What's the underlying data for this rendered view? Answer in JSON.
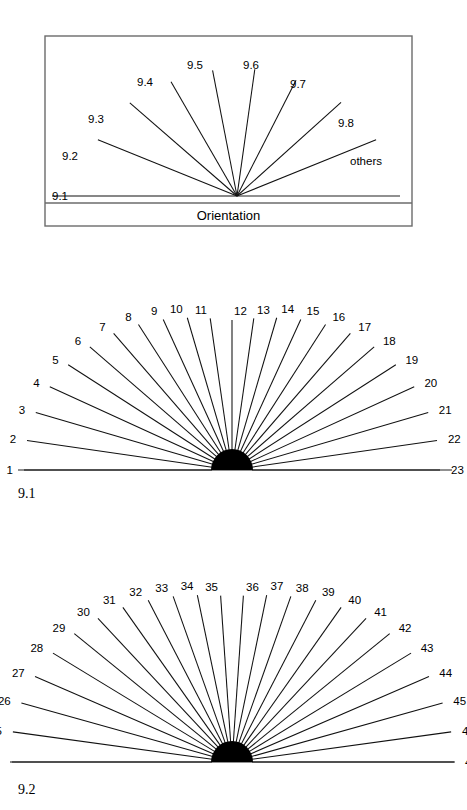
{
  "figure": {
    "background_color": "#ffffff",
    "ink_color": "#000000",
    "frame_color": "#6b6b6b"
  },
  "legend_panel": {
    "name": "orientation-legend",
    "caption": "Orientation",
    "frame": {
      "x": 45,
      "y": 8,
      "width": 367,
      "height": 190
    },
    "divider_y": 168,
    "hub": {
      "cx": 237,
      "cy": 168
    },
    "baseline": {
      "x1": 52,
      "x2": 400,
      "y": 168
    },
    "rays": [
      {
        "label": "9.1",
        "angle_deg": 180,
        "length": 185,
        "label_x": 52,
        "label_y": 172,
        "anchor": "start",
        "horizontal": true
      },
      {
        "label": "9.2",
        "angle_deg": 158,
        "length": 150,
        "label_x": 62,
        "label_y": 132,
        "anchor": "start"
      },
      {
        "label": "9.3",
        "angle_deg": 139,
        "length": 142,
        "label_x": 88,
        "label_y": 95,
        "anchor": "start"
      },
      {
        "label": "9.4",
        "angle_deg": 120,
        "length": 132,
        "label_x": 137,
        "label_y": 58,
        "anchor": "start"
      },
      {
        "label": "9.5",
        "angle_deg": 101,
        "length": 128,
        "label_x": 187,
        "label_y": 41,
        "anchor": "start"
      },
      {
        "label": "9.6",
        "angle_deg": 82,
        "length": 128,
        "label_x": 243,
        "label_y": 41,
        "anchor": "start"
      },
      {
        "label": "9.7",
        "angle_deg": 63,
        "length": 130,
        "label_x": 290,
        "label_y": 60,
        "anchor": "start"
      },
      {
        "label": "9.8",
        "angle_deg": 42,
        "length": 140,
        "label_x": 338,
        "label_y": 99,
        "anchor": "start"
      },
      {
        "label": "others",
        "angle_deg": 22,
        "length": 150,
        "label_x": 350,
        "label_y": 137,
        "anchor": "start"
      }
    ]
  },
  "panel_9_1": {
    "name": "fan-diagram-9-1",
    "tag": "9.1",
    "tag_x": 18,
    "tag_y": 240,
    "hub": {
      "cx": 232,
      "cy": 212,
      "radius": 21
    },
    "baseline": {
      "x1": 18,
      "x2": 452,
      "y": 212
    },
    "ray_count": 23,
    "ray_labels": [
      "1",
      "2",
      "3",
      "4",
      "5",
      "6",
      "7",
      "8",
      "9",
      "10",
      "11",
      "12",
      "13",
      "14",
      "15",
      "16",
      "17",
      "18",
      "19",
      "20",
      "21",
      "22",
      "23"
    ]
  },
  "panel_9_2": {
    "name": "fan-diagram-9-2",
    "tag": "9.2",
    "tag_x": 18,
    "tag_y": 278,
    "hub": {
      "cx": 232,
      "cy": 246,
      "radius": 21
    },
    "baseline": {
      "x1": 12,
      "x2": 455,
      "y": 246
    },
    "ray_count": 24,
    "ray_labels": [
      "24",
      "25",
      "26",
      "27",
      "28",
      "29",
      "30",
      "31",
      "32",
      "33",
      "34",
      "35",
      "36",
      "37",
      "38",
      "39",
      "40",
      "41",
      "42",
      "43",
      "44",
      "45",
      "46",
      "47"
    ]
  }
}
